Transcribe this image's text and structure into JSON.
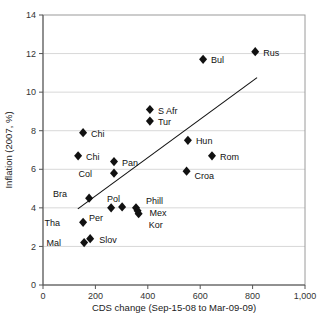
{
  "chart_data": {
    "type": "scatter",
    "title": "",
    "xlabel": "CDS change (Sep-15-08 to Mar-09-09)",
    "ylabel": "Inflation (2007, %)",
    "xlim": [
      0,
      1000
    ],
    "ylim": [
      0,
      14
    ],
    "xticks": [
      0,
      200,
      400,
      600,
      800,
      1000
    ],
    "xtick_labels": [
      "0",
      "200",
      "400",
      "600",
      "800",
      "1,000"
    ],
    "yticks": [
      0,
      2,
      4,
      6,
      8,
      10,
      12,
      14
    ],
    "ytick_labels": [
      "0",
      "2",
      "4",
      "6",
      "8",
      "10",
      "12",
      "14"
    ],
    "grid": "horizontal",
    "legend": "none",
    "marker": "diamond",
    "marker_color": "#111111",
    "points": [
      {
        "label": "Rus",
        "x": 810,
        "y": 12.1,
        "lx": 8,
        "ly": 4
      },
      {
        "label": "Bul",
        "x": 611,
        "y": 11.7,
        "lx": 8,
        "ly": 4
      },
      {
        "label": "S Afr",
        "x": 408,
        "y": 9.1,
        "lx": 8,
        "ly": 4
      },
      {
        "label": "Tur",
        "x": 408,
        "y": 8.5,
        "lx": 8,
        "ly": 4
      },
      {
        "label": "Chi",
        "x": 153,
        "y": 7.9,
        "lx": 8,
        "ly": 4
      },
      {
        "label": "Hun",
        "x": 553,
        "y": 7.5,
        "lx": 8,
        "ly": 4
      },
      {
        "label": "Chi",
        "x": 134,
        "y": 6.7,
        "lx": 8,
        "ly": 4
      },
      {
        "label": "Rom",
        "x": 645,
        "y": 6.7,
        "lx": 8,
        "ly": 4
      },
      {
        "label": "Pan",
        "x": 271,
        "y": 6.4,
        "lx": 8,
        "ly": 4
      },
      {
        "label": "Croa",
        "x": 548,
        "y": 5.9,
        "lx": 8,
        "ly": 8
      },
      {
        "label": "Col",
        "x": 271,
        "y": 5.8,
        "lx": -22,
        "ly": 4
      },
      {
        "label": "Bra",
        "x": 176,
        "y": 4.5,
        "lx": -22,
        "ly": -1
      },
      {
        "label": "Pol",
        "x": 302,
        "y": 4.05,
        "lx": -2,
        "ly": -5
      },
      {
        "label": "Per",
        "x": 260,
        "y": 4.0,
        "lx": -8,
        "ly": 13
      },
      {
        "label": "Phill",
        "x": 355,
        "y": 4.0,
        "lx": 10,
        "ly": -4
      },
      {
        "label": "Mex",
        "x": 361,
        "y": 3.85,
        "lx": 12,
        "ly": 5
      },
      {
        "label": "Kor",
        "x": 365,
        "y": 3.7,
        "lx": 10,
        "ly": 14
      },
      {
        "label": "Tha",
        "x": 153,
        "y": 3.25,
        "lx": -23,
        "ly": 4
      },
      {
        "label": "Slov",
        "x": 180,
        "y": 2.4,
        "lx": 9,
        "ly": 4
      },
      {
        "label": "Mal",
        "x": 157,
        "y": 2.2,
        "lx": -23,
        "ly": 3
      }
    ],
    "trendline": {
      "x_start": 133,
      "y_start": 3.95,
      "x_end": 817,
      "y_end": 10.75
    }
  }
}
